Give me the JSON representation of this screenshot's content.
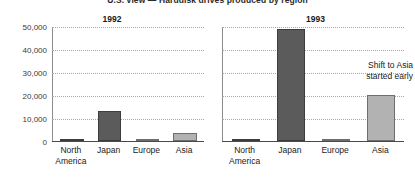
{
  "figure": {
    "title": "U.S. view — Harddisk drives produced by region"
  },
  "panels": [
    {
      "key": "1992",
      "title": "1992",
      "annotation": null
    },
    {
      "key": "1993",
      "title": "1993",
      "annotation": {
        "line1": "Shift to Asia",
        "line2": "started early"
      }
    }
  ],
  "axis": {
    "yticks": [
      "50,000",
      "40,000",
      "30,000",
      "20,000",
      "10,000",
      "0"
    ],
    "categories": [
      "North America",
      "Japan",
      "Europe",
      "Asia"
    ],
    "category_lines": [
      [
        "North",
        "America"
      ],
      [
        "Japan",
        ""
      ],
      [
        "Europe",
        ""
      ],
      [
        "Asia",
        ""
      ]
    ]
  },
  "colors": {
    "bar_dark": "#5b5b5b",
    "bar_dark_edge": "#3d3d3d",
    "bar_light": "#b2b2b2",
    "bar_light_edge": "#6e6e6e",
    "gridline": "#a8a8a8",
    "axis": "#8c8c8c",
    "text": "#1a1a1a",
    "background": "#ffffff"
  },
  "chart_data": {
    "type": "bar",
    "title": "U.S. view — Harddisk drives produced by region",
    "xlabel": "",
    "ylabel": "",
    "ylim": [
      0,
      50000
    ],
    "yticks": [
      0,
      10000,
      20000,
      30000,
      40000,
      50000
    ],
    "grid": true,
    "legend": "none",
    "categories": [
      "North America",
      "Japan",
      "Europe",
      "Asia"
    ],
    "panels": [
      {
        "name": "1992",
        "values": [
          400,
          13000,
          150,
          3500
        ],
        "bar_styles": [
          "dark",
          "dark",
          "light",
          "light"
        ]
      },
      {
        "name": "1993",
        "values": [
          800,
          49000,
          200,
          20000
        ],
        "bar_styles": [
          "dark",
          "dark",
          "light",
          "light"
        ],
        "annotations": [
          {
            "text": "Shift to Asia started early",
            "target": "Asia"
          }
        ]
      }
    ]
  }
}
